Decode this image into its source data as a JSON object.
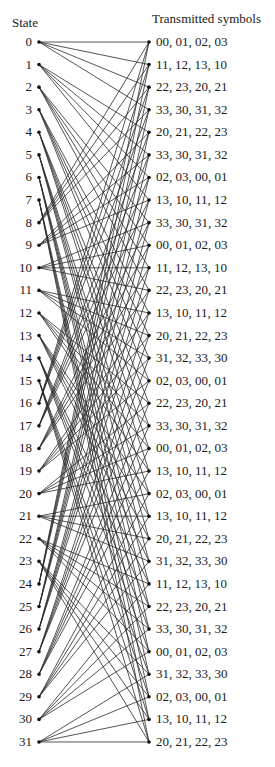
{
  "header": {
    "state_title": "State",
    "symbols_title": "Transmitted symbols"
  },
  "trellis": {
    "num_states": 32,
    "branches_per_state": 4,
    "transition_rule": "next = (4*state + k) mod 32, k=0..3",
    "left_x": 39,
    "right_x": 149,
    "top_y": 42,
    "spacing": 22.58,
    "line_color": "#2a2a2a",
    "node_color": "#111111"
  },
  "states": [
    "0",
    "1",
    "2",
    "3",
    "4",
    "5",
    "6",
    "7",
    "8",
    "9",
    "10",
    "11",
    "12",
    "13",
    "14",
    "15",
    "16",
    "17",
    "18",
    "19",
    "20",
    "21",
    "22",
    "23",
    "24",
    "25",
    "26",
    "27",
    "28",
    "29",
    "30",
    "31"
  ],
  "transmitted_symbols": [
    "00, 01, 02, 03",
    "11, 12, 13, 10",
    "22, 23, 20, 21",
    "33, 30, 31, 32",
    "20, 21, 22, 23",
    "33, 30, 31, 32",
    "02, 03, 00, 01",
    "13, 10, 11, 12",
    "33, 30, 31, 32",
    "00, 01, 02, 03",
    "11, 12, 13, 10",
    "22, 23, 20, 21",
    "13, 10, 11, 12",
    "20, 21, 22, 23",
    "31, 32, 33, 30",
    "02, 03, 00, 01",
    "22, 23, 20, 21",
    "33, 30, 31, 32",
    "00, 01, 02, 03",
    "13, 10, 11, 12",
    "02, 03, 00, 01",
    "13, 10, 11, 12",
    "20, 21, 22, 23",
    "31, 32, 33, 30",
    "11, 12, 13, 10",
    "22, 23, 20, 21",
    "33, 30, 31, 32",
    "00, 01, 02, 03",
    "31, 32, 33, 30",
    "02, 03, 00, 01",
    "13, 10, 11, 12",
    "20, 21, 22, 23"
  ]
}
